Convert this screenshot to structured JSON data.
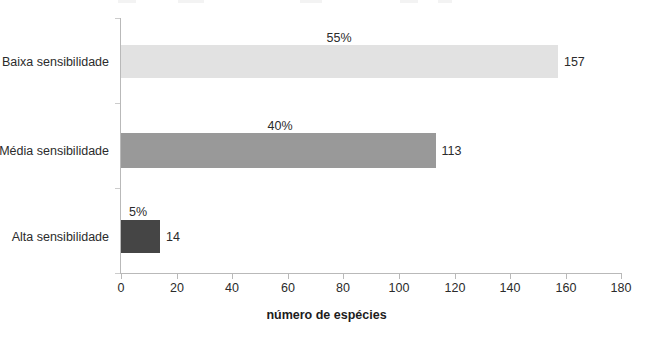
{
  "chart_data": {
    "type": "bar",
    "orientation": "horizontal",
    "title": "",
    "xlabel": "número de espécies",
    "ylabel": "",
    "categories": [
      "Baixa sensibilidade",
      "Média sensibilidade",
      "Alta sensibilidade"
    ],
    "values": [
      157,
      113,
      14
    ],
    "value_labels": [
      "157",
      "113",
      "14"
    ],
    "percent_labels": [
      "55%",
      "40%",
      "5%"
    ],
    "percent_values": [
      55,
      40,
      5
    ],
    "bar_colors": [
      "#e2e2e2",
      "#999999",
      "#454545"
    ],
    "xlim": [
      0,
      180
    ],
    "xticks": [
      0,
      20,
      40,
      60,
      80,
      100,
      120,
      140,
      160,
      180
    ],
    "xtick_labels": [
      "0",
      "20",
      "40",
      "60",
      "80",
      "100",
      "120",
      "140",
      "160",
      "180"
    ],
    "grid": false,
    "legend": "none",
    "axis_color": "#b9b9b9",
    "text_color": "#2b2b2b"
  }
}
